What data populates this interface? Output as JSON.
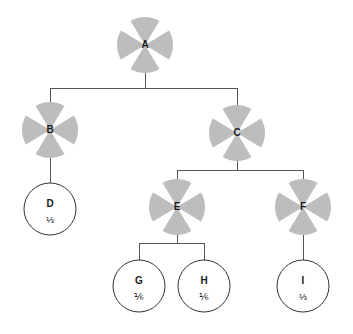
{
  "diagram": {
    "type": "tree",
    "title": "",
    "canvas": {
      "width": 353,
      "height": 334
    },
    "style": {
      "internal_node_fill": "#bdbdbd",
      "internal_node_pattern": "four-quadrant-circle-with-white-cross",
      "leaf_node_fill": "#ffffff",
      "leaf_node_stroke": "#333333",
      "edge_color": "#555555",
      "background": "#ffffff",
      "text_color": "#1a1a1a"
    },
    "nodes": [
      {
        "id": "A",
        "label": "A",
        "fraction": "",
        "kind": "internal",
        "cx": 145,
        "cy": 45,
        "r": 28
      },
      {
        "id": "B",
        "label": "B",
        "fraction": "",
        "kind": "internal",
        "cx": 50,
        "cy": 130,
        "r": 28
      },
      {
        "id": "C",
        "label": "C",
        "fraction": "",
        "kind": "internal",
        "cx": 237,
        "cy": 133,
        "r": 28
      },
      {
        "id": "D",
        "label": "D",
        "fraction": "⅓",
        "kind": "leaf",
        "cx": 50,
        "cy": 209,
        "r": 26
      },
      {
        "id": "E",
        "label": "E",
        "fraction": "",
        "kind": "internal",
        "cx": 177,
        "cy": 207,
        "r": 28
      },
      {
        "id": "F",
        "label": "F",
        "fraction": "",
        "kind": "internal",
        "cx": 303,
        "cy": 207,
        "r": 28
      },
      {
        "id": "G",
        "label": "G",
        "fraction": "⅙",
        "kind": "leaf",
        "cx": 139,
        "cy": 286,
        "r": 26
      },
      {
        "id": "H",
        "label": "H",
        "fraction": "⅙",
        "kind": "leaf",
        "cx": 204,
        "cy": 286,
        "r": 26
      },
      {
        "id": "I",
        "label": "I",
        "fraction": "⅓",
        "kind": "leaf",
        "cx": 303,
        "cy": 286,
        "r": 26
      }
    ],
    "edges": [
      {
        "from": "A",
        "to": "B",
        "bus_y": 88
      },
      {
        "from": "A",
        "to": "C",
        "bus_y": 88
      },
      {
        "from": "B",
        "to": "D",
        "bus_y": 0
      },
      {
        "from": "C",
        "to": "E",
        "bus_y": 170
      },
      {
        "from": "C",
        "to": "F",
        "bus_y": 170
      },
      {
        "from": "E",
        "to": "G",
        "bus_y": 243
      },
      {
        "from": "E",
        "to": "H",
        "bus_y": 243
      },
      {
        "from": "F",
        "to": "I",
        "bus_y": 0
      }
    ],
    "edge_groups": [
      {
        "parent": "A",
        "children": [
          "B",
          "C"
        ],
        "bus_y": 88
      },
      {
        "parent": "B",
        "children": [
          "D"
        ],
        "bus_y": null
      },
      {
        "parent": "C",
        "children": [
          "E",
          "F"
        ],
        "bus_y": 170
      },
      {
        "parent": "E",
        "children": [
          "G",
          "H"
        ],
        "bus_y": 243
      },
      {
        "parent": "F",
        "children": [
          "I"
        ],
        "bus_y": null
      }
    ]
  }
}
